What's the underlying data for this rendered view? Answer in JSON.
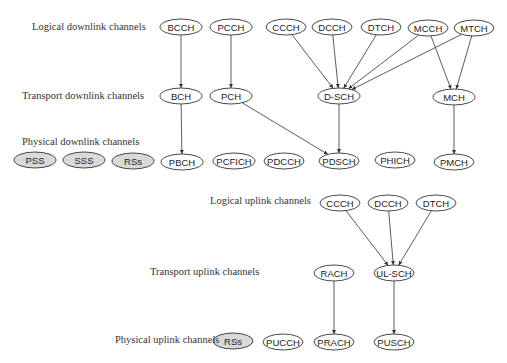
{
  "diagram": {
    "colors": {
      "line": "#333333",
      "reference_signal_fill": "#d9d9d9",
      "channel_fill": "#ffffff"
    },
    "layers": [
      {
        "id": "logical_downlink",
        "label": "Logical downlink channels",
        "x": 32,
        "y": 27
      },
      {
        "id": "transport_downlink",
        "label": "Transport downlink channels",
        "x": 22,
        "y": 96
      },
      {
        "id": "physical_downlink",
        "label": "Physical downlink channels",
        "x": 22,
        "y": 142
      },
      {
        "id": "logical_uplink",
        "label": "Logical uplink channels",
        "x": 210,
        "y": 201
      },
      {
        "id": "transport_uplink",
        "label": "Transport uplink channels",
        "x": 150,
        "y": 272
      },
      {
        "id": "physical_uplink",
        "label": "Physical uplink channels",
        "x": 115,
        "y": 340
      }
    ],
    "nodes": [
      {
        "id": "dl_bcch",
        "label": "BCCH",
        "cx": 181,
        "cy": 27,
        "rx": 21,
        "ry": 8,
        "ref": false
      },
      {
        "id": "dl_pcch",
        "label": "PCCH",
        "cx": 231,
        "cy": 27,
        "rx": 21,
        "ry": 8,
        "ref": false
      },
      {
        "id": "dl_ccch",
        "label": "CCCH",
        "cx": 286,
        "cy": 27,
        "rx": 20,
        "ry": 8,
        "ref": false
      },
      {
        "id": "dl_dcch",
        "label": "DCCH",
        "cx": 332,
        "cy": 27,
        "rx": 20,
        "ry": 8,
        "ref": false
      },
      {
        "id": "dl_dtch",
        "label": "DTCH",
        "cx": 381,
        "cy": 27,
        "rx": 20,
        "ry": 8,
        "ref": false
      },
      {
        "id": "dl_mcch",
        "label": "MCCH",
        "cx": 428,
        "cy": 28,
        "rx": 20,
        "ry": 8,
        "ref": false
      },
      {
        "id": "dl_mtch",
        "label": "MTCH",
        "cx": 474,
        "cy": 28,
        "rx": 20,
        "ry": 8,
        "ref": false
      },
      {
        "id": "bch",
        "label": "BCH",
        "cx": 181,
        "cy": 96,
        "rx": 21,
        "ry": 8,
        "ref": false
      },
      {
        "id": "pch",
        "label": "PCH",
        "cx": 231,
        "cy": 96,
        "rx": 21,
        "ry": 8,
        "ref": false
      },
      {
        "id": "dsch",
        "label": "D-SCH",
        "cx": 339,
        "cy": 96,
        "rx": 21,
        "ry": 8,
        "ref": false
      },
      {
        "id": "mch",
        "label": "MCH",
        "cx": 454,
        "cy": 97,
        "rx": 21,
        "ry": 8,
        "ref": false
      },
      {
        "id": "pss",
        "label": "PSS",
        "cx": 35,
        "cy": 160,
        "rx": 21,
        "ry": 8,
        "ref": true
      },
      {
        "id": "sss",
        "label": "SSS",
        "cx": 84,
        "cy": 160,
        "rx": 21,
        "ry": 8,
        "ref": true
      },
      {
        "id": "dl_rss",
        "label": "RSs",
        "cx": 133,
        "cy": 161,
        "rx": 21,
        "ry": 8,
        "ref": true
      },
      {
        "id": "pbch",
        "label": "PBCH",
        "cx": 182,
        "cy": 162,
        "rx": 21,
        "ry": 8,
        "ref": false
      },
      {
        "id": "pcfich",
        "label": "PCFICH",
        "cx": 234,
        "cy": 161,
        "rx": 21,
        "ry": 8,
        "ref": false
      },
      {
        "id": "pdcch",
        "label": "PDCCH",
        "cx": 284,
        "cy": 161,
        "rx": 20,
        "ry": 8,
        "ref": false
      },
      {
        "id": "pdsch",
        "label": "PDSCH",
        "cx": 339,
        "cy": 161,
        "rx": 20,
        "ry": 8,
        "ref": false
      },
      {
        "id": "phich",
        "label": "PHICH",
        "cx": 395,
        "cy": 160,
        "rx": 20,
        "ry": 8,
        "ref": false
      },
      {
        "id": "pmch",
        "label": "PMCH",
        "cx": 454,
        "cy": 162,
        "rx": 20,
        "ry": 8,
        "ref": false
      },
      {
        "id": "ul_ccch",
        "label": "CCCH",
        "cx": 340,
        "cy": 203,
        "rx": 20,
        "ry": 8,
        "ref": false
      },
      {
        "id": "ul_dcch",
        "label": "DCCH",
        "cx": 388,
        "cy": 203,
        "rx": 20,
        "ry": 8,
        "ref": false
      },
      {
        "id": "ul_dtch",
        "label": "DTCH",
        "cx": 436,
        "cy": 203,
        "rx": 20,
        "ry": 8,
        "ref": false
      },
      {
        "id": "rach",
        "label": "RACH",
        "cx": 334,
        "cy": 273,
        "rx": 20,
        "ry": 8,
        "ref": false
      },
      {
        "id": "ulsch",
        "label": "UL-SCH",
        "cx": 394,
        "cy": 273,
        "rx": 20,
        "ry": 8,
        "ref": false
      },
      {
        "id": "ul_rss",
        "label": "RSs",
        "cx": 233,
        "cy": 341,
        "rx": 20,
        "ry": 8,
        "ref": true
      },
      {
        "id": "pucch",
        "label": "PUCCH",
        "cx": 283,
        "cy": 342,
        "rx": 20,
        "ry": 8,
        "ref": false
      },
      {
        "id": "prach",
        "label": "PRACH",
        "cx": 334,
        "cy": 342,
        "rx": 20,
        "ry": 8,
        "ref": false
      },
      {
        "id": "pusch",
        "label": "PUSCH",
        "cx": 394,
        "cy": 342,
        "rx": 20,
        "ry": 8,
        "ref": false
      }
    ],
    "edges": [
      {
        "from": "dl_bcch",
        "to": "bch"
      },
      {
        "from": "dl_pcch",
        "to": "pch"
      },
      {
        "from": "dl_ccch",
        "to": "dsch"
      },
      {
        "from": "dl_dcch",
        "to": "dsch"
      },
      {
        "from": "dl_dtch",
        "to": "dsch"
      },
      {
        "from": "dl_mcch",
        "to": "dsch"
      },
      {
        "from": "dl_mtch",
        "to": "dsch"
      },
      {
        "from": "dl_mcch",
        "to": "mch"
      },
      {
        "from": "dl_mtch",
        "to": "mch"
      },
      {
        "from": "bch",
        "to": "pbch"
      },
      {
        "from": "pch",
        "to": "pdsch"
      },
      {
        "from": "dsch",
        "to": "pdsch"
      },
      {
        "from": "mch",
        "to": "pmch"
      },
      {
        "from": "ul_ccch",
        "to": "ulsch"
      },
      {
        "from": "ul_dcch",
        "to": "ulsch"
      },
      {
        "from": "ul_dtch",
        "to": "ulsch"
      },
      {
        "from": "rach",
        "to": "prach"
      },
      {
        "from": "ulsch",
        "to": "pusch"
      }
    ]
  }
}
